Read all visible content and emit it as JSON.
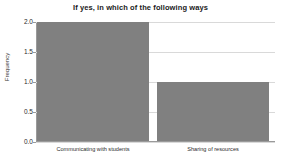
{
  "chart_data": {
    "type": "bar",
    "title": "If yes, in which of the following ways",
    "xlabel": "",
    "ylabel": "Frequency",
    "categories": [
      "Communicating with students",
      "Sharing of resources"
    ],
    "values": [
      2,
      1
    ],
    "ylim": [
      0.0,
      2.0
    ],
    "ytick_labels": [
      "0.0",
      "0.5",
      "1.0",
      "1.5",
      "2.0"
    ],
    "ytick_values": [
      0.0,
      0.5,
      1.0,
      1.5,
      2.0
    ],
    "grid": true,
    "legend": "none",
    "bar_color": "#808080",
    "background_color": "#ffffff",
    "gridline_color": "#d9d9d9",
    "axis_color": "#9a9a9a"
  }
}
